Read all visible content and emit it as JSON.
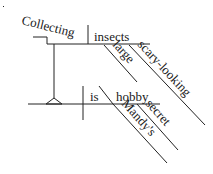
{
  "diagram": {
    "type": "sentence-diagram",
    "subject_phrase": {
      "gerund": "Collecting",
      "object": "insects",
      "object_modifiers": [
        "large",
        "scary-looking"
      ]
    },
    "verb": "is",
    "predicate_nominative": "hobby",
    "predicate_modifiers": [
      "Mandy's",
      "secret"
    ]
  },
  "colors": {
    "line": "#222222",
    "text": "#1a1a1a",
    "background": "#ffffff"
  }
}
